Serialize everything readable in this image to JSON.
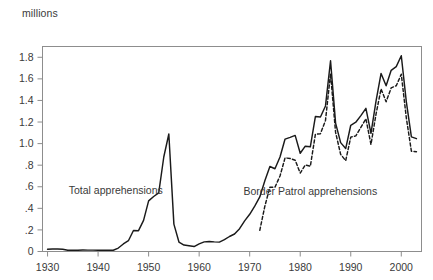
{
  "chart_data": {
    "type": "line",
    "title": "",
    "subtitle": "",
    "xlabel": "",
    "ylabel": "millions",
    "grid": false,
    "legend_position": "inline-annotations",
    "xlim": [
      1929,
      2004
    ],
    "ylim": [
      0,
      1.9
    ],
    "xticks": [
      1930,
      1940,
      1950,
      1960,
      1970,
      1980,
      1990,
      2000
    ],
    "xtick_labels": [
      "1930",
      "1940",
      "1950",
      "1960",
      "1970",
      "1980",
      "1990",
      "2000"
    ],
    "yticks": [
      0,
      0.2,
      0.4,
      0.6,
      0.8,
      1.0,
      1.2,
      1.4,
      1.6,
      1.8
    ],
    "ytick_labels": [
      "0",
      ".2",
      ".4",
      ".6",
      ".8",
      "1.0",
      "1.2",
      "1.4",
      "1.6",
      "1.8"
    ],
    "annotations": [
      {
        "text": "Total apprehensions",
        "x": 1943.5,
        "y": 0.53
      },
      {
        "text": "Border Patrol apprehensions",
        "x": 1982.0,
        "y": 0.52
      }
    ],
    "series": [
      {
        "name": "Total apprehensions",
        "style": "solid",
        "color": "#1a1a1a",
        "x": [
          1930,
          1931,
          1932,
          1933,
          1934,
          1935,
          1936,
          1937,
          1938,
          1939,
          1940,
          1941,
          1942,
          1943,
          1944,
          1945,
          1946,
          1947,
          1948,
          1949,
          1950,
          1951,
          1952,
          1953,
          1954,
          1955,
          1956,
          1957,
          1958,
          1959,
          1960,
          1961,
          1962,
          1963,
          1964,
          1965,
          1966,
          1967,
          1968,
          1969,
          1970,
          1971,
          1972,
          1973,
          1974,
          1975,
          1976,
          1977,
          1978,
          1979,
          1980,
          1981,
          1982,
          1983,
          1984,
          1985,
          1986,
          1987,
          1988,
          1989,
          1990,
          1991,
          1992,
          1993,
          1994,
          1995,
          1996,
          1997,
          1998,
          1999,
          2000,
          2001,
          2002,
          2003
        ],
        "y": [
          0.021,
          0.023,
          0.023,
          0.021,
          0.011,
          0.012,
          0.011,
          0.014,
          0.013,
          0.013,
          0.011,
          0.012,
          0.013,
          0.012,
          0.032,
          0.07,
          0.1,
          0.195,
          0.193,
          0.289,
          0.469,
          0.51,
          0.544,
          0.876,
          1.089,
          0.254,
          0.088,
          0.06,
          0.053,
          0.046,
          0.071,
          0.089,
          0.093,
          0.089,
          0.087,
          0.11,
          0.139,
          0.162,
          0.212,
          0.284,
          0.345,
          0.42,
          0.506,
          0.656,
          0.788,
          0.767,
          0.876,
          1.042,
          1.058,
          1.076,
          0.911,
          0.976,
          0.97,
          1.251,
          1.247,
          1.349,
          1.768,
          1.19,
          1.009,
          0.954,
          1.17,
          1.198,
          1.259,
          1.327,
          1.095,
          1.394,
          1.65,
          1.536,
          1.679,
          1.714,
          1.814,
          1.387,
          1.062,
          1.046
        ]
      },
      {
        "name": "Border Patrol apprehensions",
        "style": "dashed",
        "color": "#1a1a1a",
        "x": [
          1972,
          1973,
          1974,
          1975,
          1976,
          1977,
          1978,
          1979,
          1980,
          1981,
          1982,
          1983,
          1984,
          1985,
          1986,
          1987,
          1988,
          1989,
          1990,
          1991,
          1992,
          1993,
          1994,
          1995,
          1996,
          1997,
          1998,
          1999,
          2000,
          2001,
          2002,
          2003
        ],
        "y": [
          0.196,
          0.42,
          0.596,
          0.596,
          0.7,
          0.868,
          0.862,
          0.846,
          0.727,
          0.802,
          0.79,
          1.086,
          1.092,
          1.215,
          1.648,
          1.104,
          0.9,
          0.842,
          1.06,
          1.072,
          1.15,
          1.23,
          0.992,
          1.273,
          1.507,
          1.387,
          1.517,
          1.536,
          1.643,
          1.237,
          0.93,
          0.925
        ]
      }
    ]
  }
}
